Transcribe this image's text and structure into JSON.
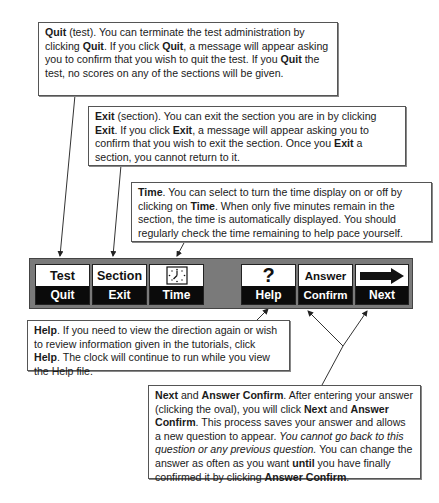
{
  "callouts": {
    "quit": {
      "segments": [
        {
          "t": "Quit",
          "b": true
        },
        {
          "t": " (test). You can terminate the test administration by clicking "
        },
        {
          "t": "Quit",
          "b": true
        },
        {
          "t": ". If you click "
        },
        {
          "t": "Quit",
          "b": true
        },
        {
          "t": ", a message will appear asking you to confirm that you wish to quit the test. If you "
        },
        {
          "t": "Quit",
          "b": true
        },
        {
          "t": " the test, no scores on any of the sections will be given."
        }
      ]
    },
    "exit": {
      "segments": [
        {
          "t": "Exit",
          "b": true
        },
        {
          "t": " (section). You can exit the section you are in by clicking "
        },
        {
          "t": "Exit",
          "b": true
        },
        {
          "t": ". If you click "
        },
        {
          "t": "Exit",
          "b": true
        },
        {
          "t": ", a message will appear asking you to confirm that you wish to exit the section. Once you "
        },
        {
          "t": "Exit",
          "b": true
        },
        {
          "t": " a section, you cannot return to it."
        }
      ]
    },
    "time": {
      "segments": [
        {
          "t": "Time",
          "b": true
        },
        {
          "t": ". You can select to turn the time display on or off by clicking on "
        },
        {
          "t": "Time",
          "b": true
        },
        {
          "t": ". When only five minutes remain in the section, the time is automatically displayed. You should regularly check the time remaining to help pace yourself."
        }
      ]
    },
    "help": {
      "segments": [
        {
          "t": "Help",
          "b": true
        },
        {
          "t": ". If you need to view the direction again or wish to review information given in the tutorials, click "
        },
        {
          "t": "Help",
          "b": true
        },
        {
          "t": ". The clock will continue to run while you view the Help file."
        }
      ]
    },
    "next": {
      "segments": [
        {
          "t": "Next",
          "b": true
        },
        {
          "t": " and "
        },
        {
          "t": "Answer Confirm",
          "b": true
        },
        {
          "t": ". After entering your answer (clicking the oval), you will click "
        },
        {
          "t": "Next",
          "b": true
        },
        {
          "t": " and "
        },
        {
          "t": "Answer Confirm",
          "b": true
        },
        {
          "t": ". This process saves your answer and allows a new question to appear. "
        },
        {
          "t": "You cannot go back to this question or any previous question.",
          "i": true
        },
        {
          "t": " You can change the answer as often as you want "
        },
        {
          "t": "until",
          "b": true
        },
        {
          "t": " you have finally confirmed it by clicking "
        },
        {
          "t": "Answer Confirm",
          "b": true
        },
        {
          "t": "."
        }
      ]
    }
  },
  "toolbar": {
    "quit": {
      "top": "Test",
      "bottom": "Quit"
    },
    "exit": {
      "top": "Section",
      "bottom": "Exit"
    },
    "time": {
      "top_icon": "clock-icon",
      "bottom": "Time"
    },
    "help": {
      "top_icon": "question-mark-icon",
      "top_glyph": "?",
      "bottom": "Help"
    },
    "confirm": {
      "top": "Answer",
      "bottom": "Confirm"
    },
    "next": {
      "top_icon": "right-arrow-icon",
      "bottom": "Next"
    }
  },
  "colors": {
    "toolbar_bg": "#7a7a7a",
    "button_label_bg": "#0b0b0b",
    "button_top_bg": "#ffffff"
  }
}
